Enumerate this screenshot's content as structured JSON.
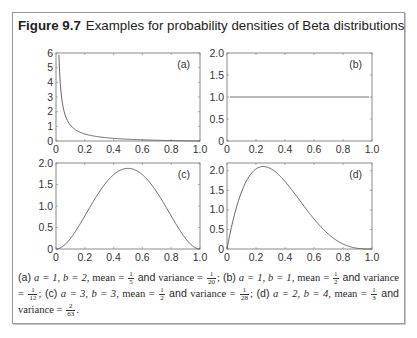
{
  "figure": {
    "label": "Figure 9.7",
    "title": "Examples for probability densities of Beta distributions"
  },
  "chart_data": [
    {
      "panel": "(a)",
      "type": "line",
      "title": "",
      "distribution": "Beta(a=1, b=2)",
      "xlabel": "",
      "ylabel": "",
      "xlim": [
        0,
        1.0
      ],
      "ylim": [
        0,
        6
      ],
      "xticks": [
        "0",
        "0.2",
        "0.4",
        "0.6",
        "0.8",
        "1.0"
      ],
      "yticks": [
        "0",
        "1",
        "2",
        "3",
        "4",
        "5",
        "6"
      ],
      "x": [
        0.02,
        0.05,
        0.1,
        0.2,
        0.3,
        0.4,
        0.5,
        0.6,
        0.7,
        0.8,
        0.9,
        1.0
      ],
      "y": [
        6.0,
        4.2,
        2.6,
        1.6,
        1.1,
        0.8,
        0.6,
        0.45,
        0.3,
        0.2,
        0.1,
        0.0
      ],
      "grid": false,
      "legend": null
    },
    {
      "panel": "(b)",
      "type": "line",
      "title": "",
      "distribution": "Beta(a=1, b=1)",
      "xlabel": "",
      "ylabel": "",
      "xlim": [
        0,
        1.0
      ],
      "ylim": [
        0,
        2.0
      ],
      "xticks": [
        "0",
        "0.2",
        "0.4",
        "0.6",
        "0.8",
        "1.0"
      ],
      "yticks": [
        "0",
        "0.5",
        "1.0",
        "1.5",
        "2.0"
      ],
      "x": [
        0,
        0.2,
        0.4,
        0.6,
        0.8,
        1.0
      ],
      "y": [
        1.0,
        1.0,
        1.0,
        1.0,
        1.0,
        1.0
      ],
      "grid": false,
      "legend": null
    },
    {
      "panel": "(c)",
      "type": "line",
      "title": "",
      "distribution": "Beta(a=3, b=3)",
      "xlabel": "",
      "ylabel": "",
      "xlim": [
        0,
        1.0
      ],
      "ylim": [
        0,
        2.0
      ],
      "xticks": [
        "0",
        "0.2",
        "0.4",
        "0.6",
        "0.8",
        "1.0"
      ],
      "yticks": [
        "0",
        "0.5",
        "1.0",
        "1.5",
        "2.0"
      ],
      "x": [
        0,
        0.1,
        0.2,
        0.3,
        0.4,
        0.5,
        0.6,
        0.7,
        0.8,
        0.9,
        1.0
      ],
      "y": [
        0,
        0.24,
        0.77,
        1.32,
        1.73,
        1.875,
        1.73,
        1.32,
        0.77,
        0.24,
        0
      ],
      "grid": false,
      "legend": null
    },
    {
      "panel": "(d)",
      "type": "line",
      "title": "",
      "distribution": "Beta(a=2, b=4)",
      "xlabel": "",
      "ylabel": "",
      "xlim": [
        0,
        1.0
      ],
      "ylim": [
        0,
        2.2
      ],
      "xticks": [
        "0",
        "0.2",
        "0.4",
        "0.6",
        "0.8",
        "1.0"
      ],
      "yticks": [
        "0",
        "0.5",
        "1.0",
        "1.5",
        "2.0"
      ],
      "x": [
        0,
        0.1,
        0.2,
        0.25,
        0.3,
        0.4,
        0.5,
        0.6,
        0.7,
        0.8,
        0.9,
        1.0
      ],
      "y": [
        0,
        1.46,
        2.05,
        2.11,
        2.06,
        1.73,
        1.25,
        0.77,
        0.38,
        0.13,
        0.02,
        0
      ],
      "grid": false,
      "legend": null
    }
  ],
  "caption": {
    "a_label": "(a)",
    "a_params": "a = 1, b = 2,",
    "a_mean_num": "1",
    "a_mean_den": "5",
    "a_var_num": "1",
    "a_var_den": "20",
    "b_label": "(b)",
    "b_params": "a = 1, b = 1,",
    "b_mean_num": "1",
    "b_mean_den": "2",
    "b_var_num": "1",
    "b_var_den": "12",
    "c_label": "(c)",
    "c_params": "a = 3, b = 3,",
    "c_mean_num": "1",
    "c_mean_den": "2",
    "c_var_num": "1",
    "c_var_den": "28",
    "d_label": "(d)",
    "d_params": "a = 2, b = 4,",
    "d_mean_num": "1",
    "d_mean_den": "3",
    "d_var_num": "2",
    "d_var_den": "63",
    "mean_word": "mean =",
    "and_word": "and",
    "variance_word": "variance ="
  }
}
